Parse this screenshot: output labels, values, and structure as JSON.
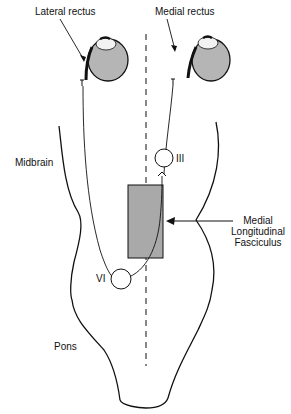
{
  "diagram": {
    "labels": {
      "lateral_rectus": "Lateral rectus",
      "medial_rectus": "Medial rectus",
      "midbrain": "Midbrain",
      "pons": "Pons",
      "nucleus_iii": "III",
      "nucleus_vi": "VI",
      "mlf_line1": "Medial",
      "mlf_line2": "Longitudinal",
      "mlf_line3": "Fasciculus"
    },
    "colors": {
      "eye_fill": "#b5b5b5",
      "mlf_fill": "#a9a9a9",
      "stroke": "#111111",
      "background": "#ffffff"
    }
  }
}
